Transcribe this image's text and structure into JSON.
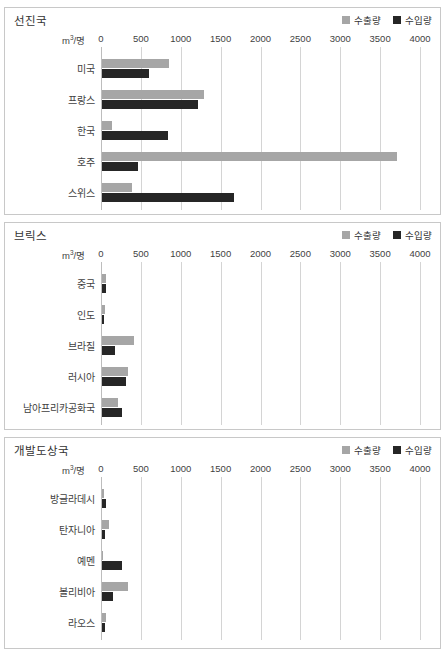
{
  "top_caption": "",
  "legend": {
    "export_label": "수출량",
    "import_label": "수입량",
    "export_color": "#a6a6a6",
    "import_color": "#262626"
  },
  "axis": {
    "unit_prefix": "m",
    "unit_sup": "3",
    "unit_suffix": "/명",
    "ticks": [
      "0",
      "500",
      "1000",
      "1500",
      "2000",
      "2500",
      "3000",
      "3500",
      "4000"
    ],
    "min": 0,
    "max": 4000,
    "step": 500
  },
  "panels": [
    {
      "title": "선진국"
    },
    {
      "title": "브릭스"
    },
    {
      "title": "개발도상국"
    }
  ],
  "chart_data": [
    {
      "type": "bar",
      "title": "선진국",
      "orientation": "horizontal",
      "xlabel": "m3/명",
      "ylabel": "",
      "xlim": [
        0,
        4000
      ],
      "grid": true,
      "legend_position": "top-right",
      "categories": [
        "미국",
        "프랑스",
        "한국",
        "호주",
        "스위스"
      ],
      "series": [
        {
          "name": "수출량",
          "color": "#a6a6a6",
          "values": [
            840,
            1285,
            120,
            3700,
            375
          ]
        },
        {
          "name": "수입량",
          "color": "#262626",
          "values": [
            590,
            1205,
            830,
            450,
            1650
          ]
        }
      ]
    },
    {
      "type": "bar",
      "title": "브릭스",
      "orientation": "horizontal",
      "xlabel": "m3/명",
      "ylabel": "",
      "xlim": [
        0,
        4000
      ],
      "grid": true,
      "legend_position": "top-right",
      "categories": [
        "중국",
        "인도",
        "브라질",
        "러시아",
        "남아프리카공화국"
      ],
      "series": [
        {
          "name": "수출량",
          "color": "#a6a6a6",
          "values": [
            55,
            35,
            400,
            330,
            205
          ]
        },
        {
          "name": "수입량",
          "color": "#262626",
          "values": [
            45,
            20,
            160,
            300,
            255
          ]
        }
      ]
    },
    {
      "type": "bar",
      "title": "개발도상국",
      "orientation": "horizontal",
      "xlabel": "m3/명",
      "ylabel": "",
      "xlim": [
        0,
        4000
      ],
      "grid": true,
      "legend_position": "top-right",
      "categories": [
        "방글라데시",
        "탄자니아",
        "예멘",
        "볼리비아",
        "라오스"
      ],
      "series": [
        {
          "name": "수출량",
          "color": "#a6a6a6",
          "values": [
            20,
            85,
            10,
            320,
            50
          ]
        },
        {
          "name": "수입량",
          "color": "#262626",
          "values": [
            55,
            35,
            245,
            140,
            35
          ]
        }
      ]
    }
  ]
}
